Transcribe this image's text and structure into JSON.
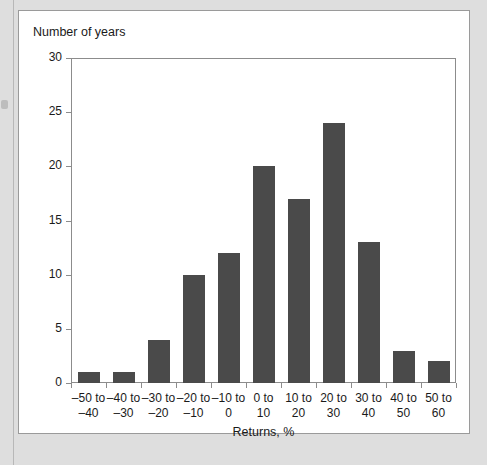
{
  "chart_data": {
    "type": "bar",
    "title": "Number of years",
    "xlabel": "Returns, %",
    "ylabel": "Number of years",
    "categories": [
      "–50 to –40",
      "–40 to –30",
      "–30 to –20",
      "–20 to –10",
      "–10 to 0",
      "0 to 10",
      "10 to 20",
      "20 to 30",
      "30 to 40",
      "40 to 50",
      "50 to 60"
    ],
    "category_lines": [
      {
        "line1": "–50 to",
        "line2": "–40"
      },
      {
        "line1": "–40 to",
        "line2": "–30"
      },
      {
        "line1": "–30 to",
        "line2": "–20"
      },
      {
        "line1": "–20 to",
        "line2": "–10"
      },
      {
        "line1": "–10 to",
        "line2": "0"
      },
      {
        "line1": "0 to",
        "line2": "10"
      },
      {
        "line1": "10 to",
        "line2": "20"
      },
      {
        "line1": "20 to",
        "line2": "30"
      },
      {
        "line1": "30 to",
        "line2": "40"
      },
      {
        "line1": "40 to",
        "line2": "50"
      },
      {
        "line1": "50 to",
        "line2": "60"
      }
    ],
    "values": [
      1,
      1,
      4,
      10,
      12,
      20,
      17,
      24,
      13,
      3,
      2
    ],
    "ylim": [
      0,
      30
    ],
    "yticks": [
      0,
      5,
      10,
      15,
      20,
      25,
      30
    ],
    "ytick_labels": [
      "0",
      "5",
      "10",
      "15",
      "20",
      "25",
      "30"
    ],
    "grid": false,
    "legend": false,
    "bar_color": "#4a4a4a",
    "axis_color": "#8c8c8c",
    "background": "#ffffff",
    "page_background": "#dedede"
  }
}
